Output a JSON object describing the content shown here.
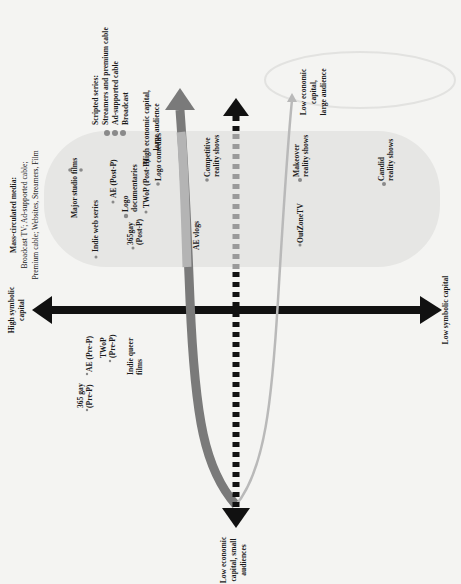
{
  "diagram": {
    "orientation": "rotated-90-ccw",
    "axes": {
      "symbolic_left": [
        "High symbolic",
        "capital"
      ],
      "symbolic_right": "Low symbolic capital",
      "bottom": [
        "Low economic",
        "capital, small",
        "audiences"
      ]
    },
    "arrows": {
      "high_econ": [
        "High economic capital,",
        "large audience"
      ],
      "low_econ_large": [
        "Low economic",
        "capital,",
        "large audience"
      ]
    },
    "mass_media": {
      "title": "Mass-circulated media:",
      "line1": "Broadcast TV; Ad-supported cable;",
      "line2": "Premium cable; Websites, Streamers, Film"
    },
    "scripted": {
      "title": "Scripted series:",
      "items": [
        "Streamers and premium cable",
        "Ad-supported cable",
        "Broadcast"
      ]
    },
    "points": {
      "major_studio": "Major studio films",
      "indie_web": "Indie web series",
      "ae_post": "AE (Post-P)",
      "logo_docs": [
        "Logo",
        "documentaries"
      ],
      "gay365_post": [
        "365gay",
        "(Post-P)"
      ],
      "twop_post": "TWoP (Post-P)",
      "logo_comedies": "Logo comedies",
      "ae_vlogs": "AE vlogs",
      "competitive": [
        "Competitive",
        "reality shows"
      ],
      "makeover": [
        "Makeover",
        "reality shows"
      ],
      "outzone": "OutZoneTV",
      "candid": [
        "Candid",
        "reality shows"
      ],
      "gay365_pre": [
        "365 gay",
        "(Pre-P)"
      ],
      "ae_pre": "AE (Pre-P)",
      "twop_pre": [
        "TWoP",
        "(Pre-P)"
      ],
      "indie_queer": [
        "Indie queer",
        "films"
      ]
    },
    "colors": {
      "black": "#111111",
      "dark_gray_arrow": "#7a7a7a",
      "light_gray_arrow": "#b9b9b9",
      "pill": "#e6e6e4",
      "dot": "#8a8a8a"
    }
  }
}
